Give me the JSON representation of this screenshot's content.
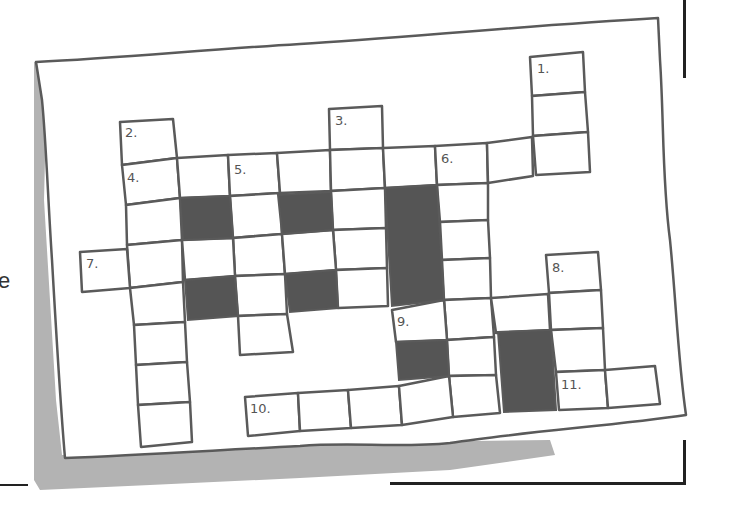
{
  "illustration": {
    "title": "Hand-drawn crossword puzzle on a sheet of paper",
    "side_text": "e",
    "colors": {
      "line": "#5a5a5a",
      "black_cell": "#555555",
      "paper": "#ffffff",
      "shadow": "#b3b3b3",
      "frame": "#222222"
    }
  },
  "crossword": {
    "clue_numbers": [
      "1.",
      "2.",
      "3.",
      "4.",
      "5.",
      "6.",
      "7.",
      "8.",
      "9.",
      "10.",
      "11."
    ],
    "labels": {
      "n1": "1.",
      "n2": "2.",
      "n3": "3.",
      "n4": "4.",
      "n5": "5.",
      "n6": "6.",
      "n7": "7.",
      "n8": "8.",
      "n9": "9.",
      "n10": "10.",
      "n11": "11."
    }
  }
}
